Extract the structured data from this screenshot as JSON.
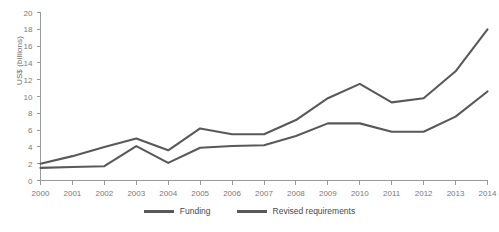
{
  "chart_data": {
    "type": "line",
    "title": "",
    "xlabel": "",
    "ylabel": "US$ (billions)",
    "categories": [
      "2000",
      "2001",
      "2002",
      "2003",
      "2004",
      "2005",
      "2006",
      "2007",
      "2008",
      "2009",
      "2010",
      "2011",
      "2012",
      "2013",
      "2014"
    ],
    "x": [
      2000,
      2001,
      2002,
      2003,
      2004,
      2005,
      2006,
      2007,
      2008,
      2009,
      2010,
      2011,
      2012,
      2013,
      2014
    ],
    "xlim": [
      2000,
      2014
    ],
    "ylim": [
      0,
      20
    ],
    "y_ticks": [
      0,
      2,
      4,
      6,
      8,
      10,
      12,
      14,
      16,
      18,
      20
    ],
    "x_ticks": [
      "2000",
      "2001",
      "2002",
      "2003",
      "2004",
      "2005",
      "2006",
      "2007",
      "2008",
      "2009",
      "2010",
      "2011",
      "2012",
      "2013",
      "2014"
    ],
    "grid": false,
    "legend_position": "bottom",
    "series": [
      {
        "name": "Revised requirements",
        "color": "#595959",
        "values": [
          2.0,
          2.9,
          4.0,
          5.0,
          3.6,
          6.2,
          5.5,
          5.5,
          7.2,
          9.8,
          11.5,
          9.3,
          9.8,
          13.0,
          18.0
        ]
      },
      {
        "name": "Funding",
        "color": "#595959",
        "values": [
          1.5,
          1.6,
          1.7,
          4.1,
          2.1,
          3.9,
          4.1,
          4.2,
          5.3,
          6.8,
          6.8,
          5.8,
          5.8,
          7.6,
          10.6
        ]
      }
    ]
  },
  "axis": {
    "y_title": "US$ (billions)"
  },
  "legend": {
    "items": [
      {
        "label": "Funding"
      },
      {
        "label": "Revised requirements"
      }
    ]
  }
}
